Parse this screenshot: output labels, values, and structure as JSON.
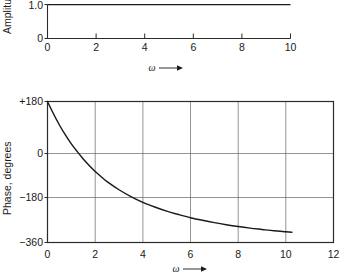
{
  "chart_data": [
    {
      "type": "line",
      "title": "",
      "subtitle": "",
      "ylabel": "Amplitude",
      "xlabel": "ω",
      "xlabel_arrow": "⟶",
      "xlim": [
        0,
        10
      ],
      "ylim": [
        0,
        1.15
      ],
      "grid": false,
      "xticks": [
        0,
        2,
        4,
        6,
        8,
        10
      ],
      "xtick_labels": [
        "0",
        "2",
        "4",
        "6",
        "8",
        "10"
      ],
      "yticks": [
        0,
        1.0
      ],
      "ytick_labels": [
        "0",
        "1.0"
      ],
      "legend": [],
      "series": [
        {
          "name": "amplitude",
          "x": [
            0,
            1,
            2,
            3,
            4,
            5,
            6,
            7,
            8,
            9,
            10
          ],
          "values": [
            1.0,
            1.0,
            1.0,
            1.0,
            1.0,
            1.0,
            1.0,
            1.0,
            1.0,
            1.0,
            1.0
          ]
        }
      ]
    },
    {
      "type": "line",
      "title": "",
      "subtitle": "",
      "ylabel": "Phase, degrees",
      "xlabel": "ω",
      "xlabel_arrow": "⟶",
      "xlim": [
        0,
        12
      ],
      "ylim": [
        -360,
        180
      ],
      "grid": true,
      "xticks": [
        0,
        2,
        4,
        6,
        8,
        10,
        12
      ],
      "xtick_labels": [
        "0",
        "2",
        "4",
        "6",
        "8",
        "10",
        "12"
      ],
      "yticks": [
        180,
        0,
        -180,
        -360
      ],
      "ytick_labels": [
        "+180",
        "0",
        "−180",
        "−360"
      ],
      "legend": [],
      "series": [
        {
          "name": "phase",
          "x": [
            0,
            0.25,
            0.5,
            0.75,
            1.0,
            1.25,
            1.5,
            1.75,
            2.0,
            2.25,
            2.5,
            3.0,
            3.5,
            4.0,
            4.5,
            5.0,
            5.5,
            6.0,
            6.5,
            7.0,
            7.5,
            8.0,
            8.5,
            9.0,
            9.5,
            10.0,
            10.25
          ],
          "values": [
            180,
            133,
            90,
            52,
            18,
            -12,
            -40,
            -65,
            -88,
            -108,
            -127,
            -158,
            -184,
            -206,
            -224,
            -240,
            -253,
            -265,
            -275,
            -284,
            -292,
            -299,
            -305,
            -310,
            -315,
            -319,
            -321
          ]
        }
      ]
    }
  ],
  "labels": {
    "amplitude_axis": "Amplitude",
    "phase_axis": "Phase, degrees",
    "omega": "ω",
    "amp_y_0": "0",
    "amp_y_1": "1.0",
    "amp_x_0": "0",
    "amp_x_2": "2",
    "amp_x_4": "4",
    "amp_x_6": "6",
    "amp_x_8": "8",
    "amp_x_10": "10",
    "ph_y_p180": "+180",
    "ph_y_0": "0",
    "ph_y_m180": "−180",
    "ph_y_m360": "−360",
    "ph_x_0": "0",
    "ph_x_2": "2",
    "ph_x_4": "4",
    "ph_x_6": "6",
    "ph_x_8": "8",
    "ph_x_10": "10",
    "ph_x_12": "12"
  },
  "colors": {
    "background": "#ffffff",
    "curve": "#1a1a1a",
    "axis": "#2b2b2b",
    "grid": "#666666"
  }
}
